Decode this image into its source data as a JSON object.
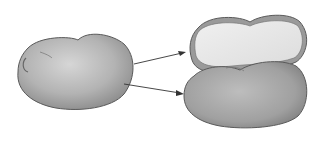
{
  "figure": {
    "colors": {
      "background": "#ffffff",
      "outline": "#555555",
      "seed_coat": "#b8b8b8",
      "seed_coat_dark": "#8e8e8e",
      "cotyledon_inner": "#e8e8e8",
      "arrow": "#333333"
    }
  }
}
